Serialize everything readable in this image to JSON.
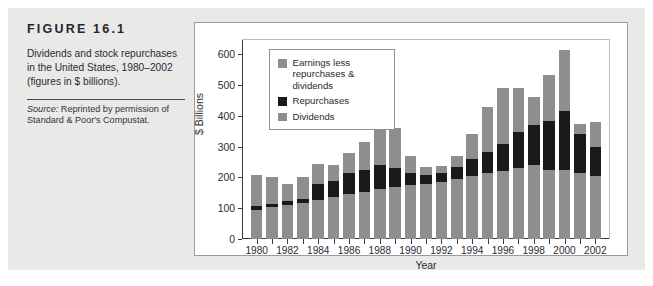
{
  "figure": {
    "label": "FIGURE 16.1",
    "description": "Dividends and stock repurchases in the United States, 1980–2002 (figures in $ billions).",
    "source_word": "Source:",
    "source_text": " Reprinted by permission of Standard & Poor's Compustat."
  },
  "colors": {
    "dividends": "#8e8e8e",
    "repurchases": "#1a1a1a",
    "earnings_less": "#8e8e8e",
    "axis": "#3a3a42",
    "panel_border": "#9a9aa0",
    "page_plate": "#e9e9e7"
  },
  "chart_data": {
    "type": "bar",
    "stacked": true,
    "title": "",
    "xlabel": "Year",
    "ylabel": "$ Billions",
    "ylim": [
      0,
      650
    ],
    "yticks": [
      0,
      100,
      200,
      300,
      400,
      500,
      600
    ],
    "grid": false,
    "legend_position": "inside-top-left",
    "categories": [
      "1980",
      "1981",
      "1982",
      "1983",
      "1984",
      "1985",
      "1986",
      "1987",
      "1988",
      "1989",
      "1990",
      "1991",
      "1992",
      "1993",
      "1994",
      "1995",
      "1996",
      "1997",
      "1998",
      "1999",
      "2000",
      "2001",
      "2002"
    ],
    "xtick_labels": [
      "1980",
      "1982",
      "1984",
      "1986",
      "1988",
      "1990",
      "1992",
      "1994",
      "1996",
      "1998",
      "2000",
      "2002"
    ],
    "series": [
      {
        "name": "Dividends",
        "color": "#8e8e8e",
        "values": [
          95,
          103,
          110,
          118,
          128,
          135,
          145,
          152,
          162,
          170,
          176,
          180,
          186,
          195,
          205,
          215,
          222,
          230,
          240,
          225,
          225,
          215,
          205
        ]
      },
      {
        "name": "Repurchases",
        "color": "#1a1a1a",
        "values": [
          13,
          12,
          15,
          12,
          50,
          52,
          68,
          72,
          78,
          62,
          38,
          28,
          30,
          38,
          55,
          68,
          88,
          118,
          132,
          158,
          190,
          125,
          95
        ]
      },
      {
        "name": "Earnings less repurchases & dividends",
        "color": "#8e8e8e",
        "values": [
          100,
          85,
          53,
          70,
          65,
          52,
          68,
          92,
          172,
          130,
          57,
          25,
          20,
          37,
          80,
          145,
          180,
          143,
          90,
          150,
          200,
          35,
          80
        ]
      }
    ],
    "totals": [
      208,
      200,
      178,
      200,
      243,
      239,
      281,
      316,
      412,
      362,
      271,
      233,
      236,
      270,
      340,
      428,
      490,
      491,
      462,
      533,
      615,
      375,
      380
    ],
    "legend_entries": [
      {
        "label": "Earnings less repurchases & dividends",
        "color": "#8e8e8e"
      },
      {
        "label": "Repurchases",
        "color": "#1a1a1a"
      },
      {
        "label": "Dividends",
        "color": "#8e8e8e"
      }
    ]
  }
}
